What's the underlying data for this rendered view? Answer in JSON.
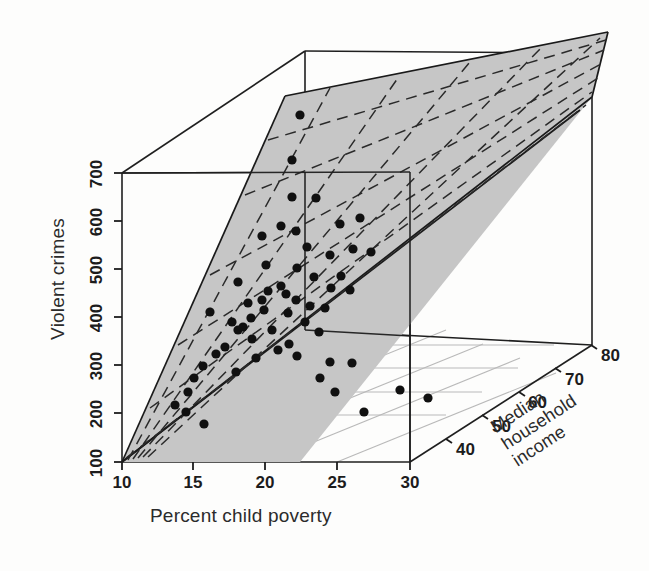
{
  "figure": {
    "kind": "3d-scatter-with-regression-plane",
    "background_color": "#fdfdfc",
    "plane_fill_color": "#c6c6c6",
    "plane_edge_color": "#1a1a1a",
    "gridline_color": "#b9b9b9",
    "point_color": "#101010",
    "box_edge_color": "#1f1f1f"
  },
  "axes": {
    "x": {
      "title": "Percent child poverty",
      "ticks": [
        "10",
        "15",
        "20",
        "25",
        "30"
      ],
      "values": [
        10,
        15,
        20,
        25,
        30
      ],
      "range": [
        10,
        30
      ]
    },
    "y": {
      "title": "Violent crimes",
      "ticks": [
        "100",
        "200",
        "300",
        "400",
        "500",
        "600",
        "700"
      ],
      "values": [
        100,
        200,
        300,
        400,
        500,
        600,
        700
      ],
      "range": [
        100,
        700
      ]
    },
    "z": {
      "title_lines": [
        "Median",
        "household",
        "income"
      ],
      "ticks": [
        "40",
        "50",
        "60",
        "70",
        "80"
      ],
      "values": [
        40,
        50,
        60,
        70,
        80
      ],
      "range": [
        30,
        80
      ]
    }
  },
  "chart_data": {
    "type": "scatter",
    "title": "",
    "xlabel": "Percent child poverty",
    "ylabel": "Violent crimes",
    "zlabel": "Median household income",
    "xlim": [
      10,
      30
    ],
    "ylim": [
      100,
      700
    ],
    "zlim": [
      30,
      80
    ],
    "grid": true,
    "legend": "none",
    "projection": "3d",
    "plane": {
      "description": "fitted regression plane of violent crimes on percent child poverty and median household income",
      "style": "shaded gray with dashed mesh lines",
      "mesh_line_style": "dashed"
    },
    "points_px": [
      [
        300,
        115
      ],
      [
        292,
        160
      ],
      [
        292,
        197
      ],
      [
        316,
        198
      ],
      [
        281,
        226
      ],
      [
        296,
        231
      ],
      [
        262,
        236
      ],
      [
        340,
        224
      ],
      [
        360,
        218
      ],
      [
        353,
        249
      ],
      [
        307,
        247
      ],
      [
        330,
        255
      ],
      [
        266,
        265
      ],
      [
        297,
        268
      ],
      [
        371,
        252
      ],
      [
        314,
        277
      ],
      [
        341,
        276
      ],
      [
        238,
        282
      ],
      [
        281,
        286
      ],
      [
        268,
        291
      ],
      [
        286,
        294
      ],
      [
        331,
        288
      ],
      [
        350,
        290
      ],
      [
        296,
        300
      ],
      [
        262,
        300
      ],
      [
        248,
        303
      ],
      [
        310,
        306
      ],
      [
        264,
        310
      ],
      [
        325,
        308
      ],
      [
        288,
        313
      ],
      [
        210,
        312
      ],
      [
        251,
        318
      ],
      [
        232,
        322
      ],
      [
        243,
        327
      ],
      [
        238,
        330
      ],
      [
        305,
        322
      ],
      [
        272,
        330
      ],
      [
        319,
        332
      ],
      [
        252,
        339
      ],
      [
        289,
        344
      ],
      [
        225,
        347
      ],
      [
        216,
        354
      ],
      [
        278,
        350
      ],
      [
        297,
        356
      ],
      [
        256,
        358
      ],
      [
        330,
        362
      ],
      [
        352,
        363
      ],
      [
        203,
        366
      ],
      [
        236,
        372
      ],
      [
        194,
        378
      ],
      [
        320,
        378
      ],
      [
        188,
        392
      ],
      [
        335,
        392
      ],
      [
        175,
        405
      ],
      [
        400,
        390
      ],
      [
        186,
        412
      ],
      [
        364,
        412
      ],
      [
        204,
        424
      ],
      [
        428,
        398
      ]
    ],
    "n_points": 59,
    "note": "Points are black filled circles; coordinates are screen pixel positions within the 3D box."
  },
  "geometry": {
    "origin_px": [
      122,
      462
    ],
    "x_axis_end_px": [
      410,
      462
    ],
    "y_axis_top_px": [
      122,
      173
    ],
    "z_axis_end_px": [
      592,
      345
    ],
    "box_front_top_right_px": [
      592,
      53
    ],
    "box_back_top_left_px": [
      305,
      51
    ]
  }
}
